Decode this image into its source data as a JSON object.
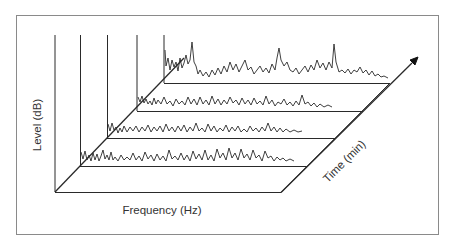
{
  "diagram": {
    "type": "waterfall-spectrum-3d",
    "axes": {
      "level_label": "Level (dB)",
      "frequency_label": "Frequency (Hz)",
      "time_label": "Time (min)"
    },
    "spectra_count": 4,
    "colors": {
      "line": "#2a2a2a",
      "border": "#8a8a8a",
      "background": "#ffffff"
    }
  }
}
